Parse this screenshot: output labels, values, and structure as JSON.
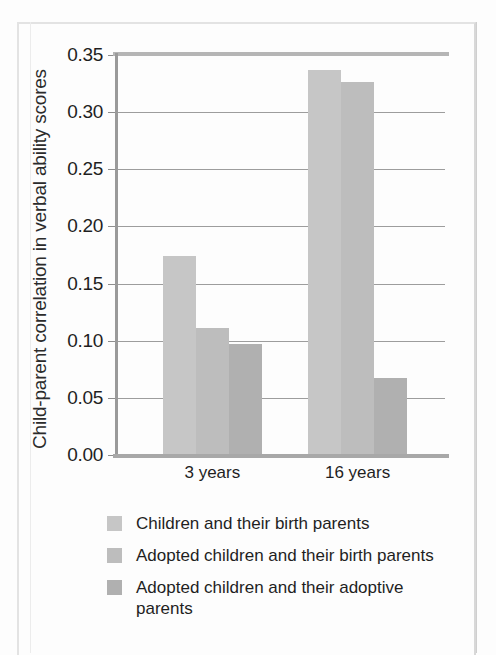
{
  "figure": {
    "ylabel": "Child-parent correlation in verbal ability scores"
  },
  "chart_data": {
    "type": "bar",
    "title": "",
    "xlabel": "",
    "ylabel": "Child-parent correlation in verbal ability scores",
    "categories": [
      "3 years",
      "16 years"
    ],
    "series": [
      {
        "name": "Children and their birth parents",
        "color": "#c6c6c6",
        "values": [
          0.174,
          0.337
        ]
      },
      {
        "name": "Adopted children and their birth parents",
        "color": "#bdbdbd",
        "values": [
          0.111,
          0.326
        ]
      },
      {
        "name": "Adopted children and their adoptive parents",
        "color": "#b0b0b0",
        "values": [
          0.097,
          0.067
        ]
      }
    ],
    "ylim": [
      0.0,
      0.35
    ],
    "yticks": [
      0.0,
      0.05,
      0.1,
      0.15,
      0.2,
      0.25,
      0.3,
      0.35
    ],
    "ytick_labels": [
      "0.00",
      "0.05",
      "0.10",
      "0.15",
      "0.20",
      "0.25",
      "0.30",
      "0.35"
    ],
    "grid": true,
    "legend_position": "below"
  },
  "legend": {
    "items": [
      {
        "label": "Children and their birth parents",
        "color": "#c6c6c6"
      },
      {
        "label": "Adopted children and their birth parents",
        "color": "#bdbdbd"
      },
      {
        "label": "Adopted children and their adoptive parents",
        "color": "#b0b0b0"
      }
    ]
  }
}
